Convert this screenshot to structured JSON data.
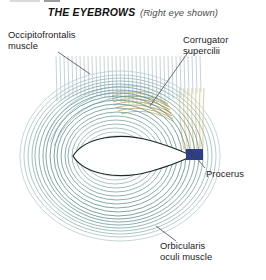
{
  "figure": {
    "title_main": "THE EYEBROWS",
    "title_sub": "(Right eye shown)",
    "view_note": "Right eye shown",
    "labels": {
      "occipitofrontalis": "Occipitofrontalis\nmuscle",
      "occipitofrontalis_line1": "Occipitofrontalis",
      "occipitofrontalis_line2": "muscle",
      "corrugator_line1": "Corrugator",
      "corrugator_line2": "supercilii",
      "procerus": "Procerus",
      "orbicularis_line1": "Orbicularis",
      "orbicularis_line2": "oculi muscle"
    },
    "structures": [
      {
        "name": "Occipitofrontalis muscle",
        "icon": "vertical-fiber-bundle",
        "color": "#a8bcc6",
        "description": "Vertical striated fibers across the superior brow"
      },
      {
        "name": "Corrugator supercilii",
        "icon": "oblique-arc-band",
        "color": "#c9b46a",
        "description": "Tan oblique arc beneath the medial brow"
      },
      {
        "name": "Procerus",
        "icon": "navy-insertion-block",
        "color": "#2e3f86",
        "description": "Medial insertion block with pale cream descending fibers"
      },
      {
        "name": "Orbicularis oculi muscle",
        "icon": "concentric-ring-sphincter",
        "color": "#6d9494",
        "description": "Concentric elliptical rings encircling the palpebral fissure"
      }
    ],
    "palette": {
      "ring_dark": "#4d7a7a",
      "ring_mid": "#7ba0a0",
      "ring_light": "#aac4c4",
      "fiber_blue": "#9db4c2",
      "corrugator_tan": "#c4ae68",
      "procerus_cream": "#ece4bc",
      "procerus_block": "#2e3f86",
      "eye_outline": "#1f2a2a",
      "eye_fill": "#ffffff",
      "leader": "#3a3a3a",
      "text": "#1c1c1c",
      "subtitle": "#4d4d4d"
    },
    "eye_opening": {
      "shape": "almond",
      "fill": "#ffffff",
      "medial_canthus_x": 190,
      "lateral_canthus_x": 73,
      "center_y": 155
    }
  }
}
